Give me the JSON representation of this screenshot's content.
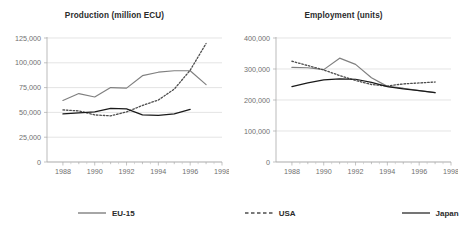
{
  "legend": {
    "items": [
      {
        "label": "EU-15",
        "style": "solid",
        "color": "#808080"
      },
      {
        "label": "USA",
        "style": "dashed",
        "color": "#4d4d4d"
      },
      {
        "label": "Japan",
        "style": "solid",
        "color": "#1a1a1a"
      }
    ]
  },
  "chart_data": [
    {
      "type": "line",
      "title": "Production (million ECU)",
      "xlabel": "",
      "ylabel": "",
      "x": [
        1988,
        1989,
        1990,
        1991,
        1992,
        1993,
        1994,
        1995,
        1996,
        1997
      ],
      "xlim": [
        1987,
        1998
      ],
      "xticks": [
        1988,
        1990,
        1992,
        1994,
        1996,
        1998
      ],
      "xticklabels": [
        "1988",
        "1990",
        "1992",
        "1994",
        "1996",
        "1998"
      ],
      "ylim": [
        0,
        125000
      ],
      "yticks": [
        0,
        25000,
        50000,
        75000,
        100000,
        125000
      ],
      "yticklabels": [
        "0",
        "25,000",
        "50,000",
        "75,000",
        "100,000",
        "125,000"
      ],
      "grid": true,
      "legend_position": "bottom",
      "series": [
        {
          "name": "EU-15",
          "style": "solid",
          "color": "#808080",
          "values": [
            62000,
            69000,
            65500,
            75000,
            74500,
            87000,
            90500,
            92000,
            92000,
            78000
          ]
        },
        {
          "name": "USA",
          "style": "dashed",
          "color": "#4d4d4d",
          "values": [
            52500,
            51500,
            47500,
            46500,
            50500,
            57000,
            62500,
            73500,
            92500,
            119500
          ]
        },
        {
          "name": "Japan",
          "style": "solid",
          "color": "#1a1a1a",
          "values": [
            48500,
            49500,
            50500,
            54000,
            53500,
            47500,
            47000,
            48500,
            53000,
            null
          ]
        }
      ]
    },
    {
      "type": "line",
      "title": "Employment (units)",
      "xlabel": "",
      "ylabel": "",
      "x": [
        1988,
        1989,
        1990,
        1991,
        1992,
        1993,
        1994,
        1995,
        1996,
        1997
      ],
      "xlim": [
        1987,
        1998
      ],
      "xticks": [
        1988,
        1990,
        1992,
        1994,
        1996,
        1998
      ],
      "xticklabels": [
        "1988",
        "1990",
        "1992",
        "1994",
        "1996",
        "1998"
      ],
      "ylim": [
        0,
        400000
      ],
      "yticks": [
        0,
        100000,
        200000,
        300000,
        400000
      ],
      "yticklabels": [
        "0",
        "100,000",
        "200,000",
        "300,000",
        "400,000"
      ],
      "grid": true,
      "legend_position": "bottom",
      "series": [
        {
          "name": "EU-15",
          "style": "solid",
          "color": "#808080",
          "values": [
            305000,
            304000,
            298000,
            335000,
            315000,
            272000,
            244000,
            238000,
            230000,
            224000
          ]
        },
        {
          "name": "USA",
          "style": "dashed",
          "color": "#4d4d4d",
          "values": [
            325000,
            311000,
            297000,
            279000,
            263000,
            250000,
            245000,
            252000,
            255000,
            258000
          ]
        },
        {
          "name": "Japan",
          "style": "solid",
          "color": "#1a1a1a",
          "values": [
            243000,
            255000,
            265000,
            268000,
            267000,
            257000,
            243000,
            236000,
            230000,
            224000
          ]
        }
      ]
    }
  ]
}
